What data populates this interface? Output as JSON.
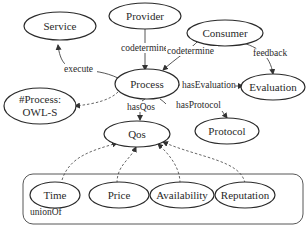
{
  "diagram": {
    "nodes": {
      "service": "Service",
      "provider": "Provider",
      "consumer": "Consumer",
      "process": "Process",
      "evaluation": "Evaluation",
      "owls_line1": "#Process:",
      "owls_line2": "OWL-S",
      "protocol": "Protocol",
      "qos": "Qos",
      "time": "Time",
      "price": "Price",
      "availability": "Availability",
      "reputation": "Reputation"
    },
    "edges": {
      "execute": "execute",
      "provider_codetermine": "codetermine",
      "consumer_codetermine": "codetermine",
      "feedback": "feedback",
      "hasEvaluation": "hasEvaluation",
      "hasQos": "hasQos",
      "hasProtocol": "hasProtocol"
    },
    "group_label": "unionOf",
    "colors": {
      "stroke": "#2a2a2a",
      "background": "#ffffff"
    }
  }
}
